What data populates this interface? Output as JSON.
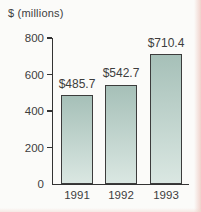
{
  "figure": {
    "unit_label": "$ (millions)"
  },
  "chart_data": {
    "type": "bar",
    "title": "$ (millions)",
    "categories": [
      "1991",
      "1992",
      "1993"
    ],
    "values": [
      485.7,
      542.7,
      710.4
    ],
    "bar_labels": [
      "$485.7",
      "$542.7",
      "$710.4"
    ],
    "xlabel": "",
    "ylabel": "$ (millions)",
    "ylim": [
      0,
      800
    ],
    "yticks": [
      0,
      200,
      400,
      600,
      800
    ],
    "ytick_labels": [
      "0",
      "200",
      "400",
      "600",
      "800"
    ],
    "grid": false,
    "legend": "none",
    "colors": {
      "background": "#fbfbf9",
      "text": "#3d3d3d",
      "axis": "#333333",
      "bar_border": "#3c3c3c",
      "bar_gradient_top": "#a6c0b8",
      "bar_gradient_bottom": "#dae7e2",
      "page_edge_tint": "#f0d2cb"
    }
  }
}
